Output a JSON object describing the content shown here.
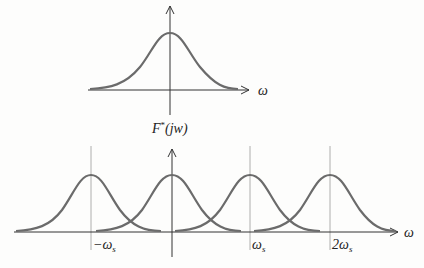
{
  "diagram": {
    "top_plot": {
      "axis_label_x": "ω",
      "description": "Original continuous spectrum, single bell-shaped curve centered at 0"
    },
    "bottom_plot": {
      "axis_label_y_main": "F",
      "axis_label_y_sup": "*",
      "axis_label_y_arg": "(jw)",
      "axis_label_x": "ω",
      "ticks": [
        {
          "prefix": "−ω",
          "sub": "s"
        },
        {
          "prefix": "ω",
          "sub": "s"
        },
        {
          "prefix": "2ω",
          "sub": "s"
        }
      ],
      "description": "Sampled spectrum: replicas centered at −ωs, 0, ωs, 2ωs overlapping (aliasing)"
    },
    "colors": {
      "curve": "#6b6b6b",
      "axis": "#333333",
      "dashed": "#9a9a9a"
    }
  }
}
